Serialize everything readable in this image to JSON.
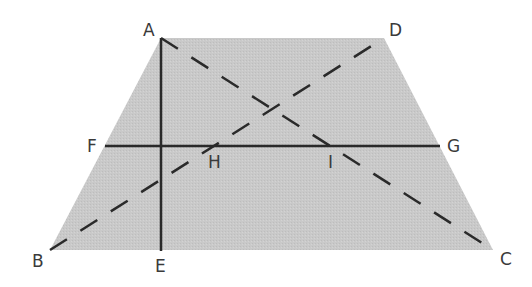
{
  "diagram": {
    "type": "trapezoid-geometry",
    "fill_color": "#c9c9c9",
    "line_color": "#2a2a2a",
    "points": {
      "A": {
        "label": "A",
        "x": 161,
        "y": 38
      },
      "D": {
        "label": "D",
        "x": 384,
        "y": 38
      },
      "B": {
        "label": "B",
        "x": 50,
        "y": 250
      },
      "C": {
        "label": "C",
        "x": 493,
        "y": 250
      },
      "F": {
        "label": "F",
        "x": 105,
        "y": 145
      },
      "G": {
        "label": "G",
        "x": 440,
        "y": 145
      },
      "E": {
        "label": "E",
        "x": 161,
        "y": 250
      },
      "H": {
        "label": "H"
      },
      "I": {
        "label": "I"
      }
    },
    "segments": [
      {
        "from": "A",
        "to": "E",
        "style": "solid"
      },
      {
        "from": "F",
        "to": "G",
        "style": "solid"
      },
      {
        "from": "A",
        "to": "C",
        "style": "dashed"
      },
      {
        "from": "B",
        "to": "D",
        "style": "dashed"
      }
    ],
    "labels": [
      "A",
      "D",
      "F",
      "G",
      "H",
      "I",
      "B",
      "E",
      "C"
    ]
  }
}
